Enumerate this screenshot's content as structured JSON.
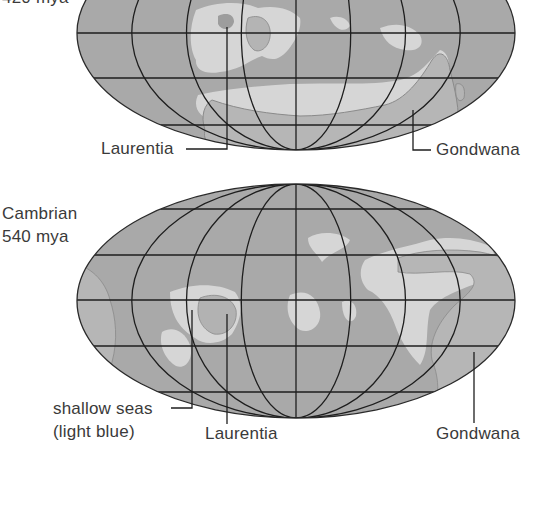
{
  "figure": {
    "colors": {
      "ocean": "#a9a9a9",
      "shallow_sea": "#d6d6d6",
      "land": "#b4b4b4",
      "grid": "#1e1e1e",
      "text": "#3a3a3a"
    }
  },
  "maps": [
    {
      "id": "upper",
      "period_label": "",
      "age_label": "420 mya",
      "annotations": [
        {
          "text": "Laurentia"
        },
        {
          "text": "Gondwana"
        }
      ]
    },
    {
      "id": "lower",
      "period_label": "Cambrian",
      "age_label": "540 mya",
      "annotations": [
        {
          "text": "shallow seas"
        },
        {
          "text": "(light blue)"
        },
        {
          "text": "Laurentia"
        },
        {
          "text": "Gondwana"
        }
      ]
    }
  ]
}
